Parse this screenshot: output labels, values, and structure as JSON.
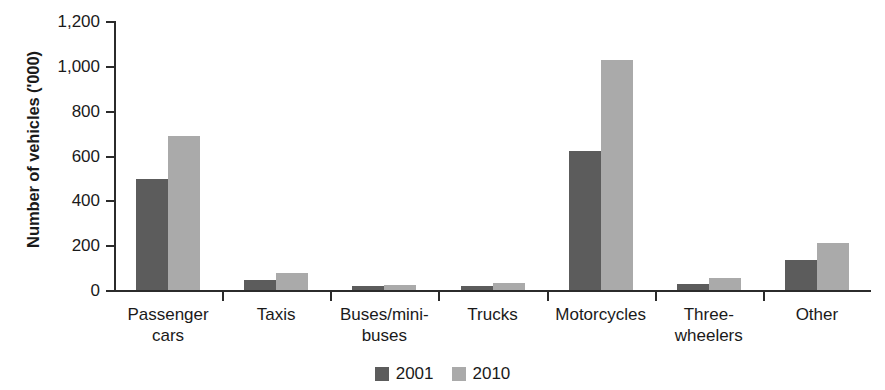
{
  "chart_data": {
    "type": "bar",
    "title": "",
    "subtitle": "",
    "xlabel": "",
    "ylabel": "Number of vehicles ('000)",
    "categories": [
      "Passenger\ncars",
      "Taxis",
      "Buses/mini-\nbuses",
      "Trucks",
      "Motorcycles",
      "Three-\nwheelers",
      "Other"
    ],
    "series": [
      {
        "name": "2001",
        "color": "#5c5c5c",
        "values": [
          495,
          45,
          20,
          20,
          620,
          25,
          135
        ]
      },
      {
        "name": "2010",
        "color": "#aaaaaa",
        "values": [
          685,
          78,
          22,
          30,
          1025,
          55,
          210
        ]
      }
    ],
    "ylim": [
      0,
      1200
    ],
    "ytick_values": [
      0,
      200,
      400,
      600,
      800,
      1000,
      1200
    ],
    "ytick_labels": [
      "0",
      "200",
      "400",
      "600",
      "800",
      "1,000",
      "1,200"
    ],
    "grid": false,
    "legend_position": "bottom-center"
  },
  "legend": {
    "items": [
      {
        "label": "2001",
        "swatch": "dark-gray-swatch"
      },
      {
        "label": "2010",
        "swatch": "light-gray-swatch"
      }
    ]
  }
}
